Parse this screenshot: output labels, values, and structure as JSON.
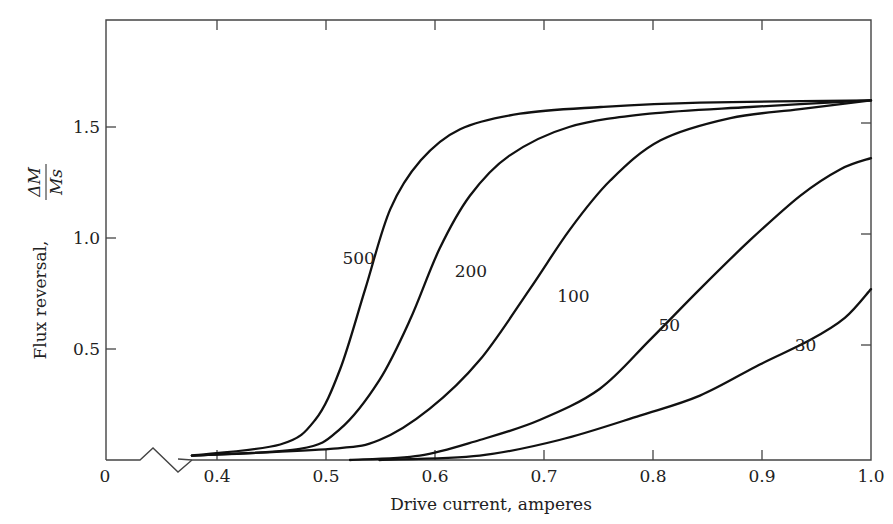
{
  "chart_data": {
    "type": "line",
    "title": "",
    "xlabel": "Drive current, amperes",
    "ylabel": "Flux reversal, ΔM / Ms",
    "ylabel_parts": {
      "text": "Flux reversal,",
      "numerator": "ΔM",
      "denominator": "Ms"
    },
    "xlim": [
      0.4,
      1.0
    ],
    "ylim": [
      0,
      1.95
    ],
    "x_axis_break": true,
    "x_origin_label": "0",
    "x_ticks": [
      0.4,
      0.5,
      0.6,
      0.7,
      0.8,
      0.9,
      1.0
    ],
    "x_tick_labels": [
      "0.4",
      "0.5",
      "0.6",
      "0.7",
      "0.8",
      "0.9",
      "1.0"
    ],
    "y_ticks": [
      0.5,
      1.0,
      1.5
    ],
    "y_tick_labels": [
      "0.5",
      "1.0",
      "1.5"
    ],
    "grid": false,
    "legend": "inline curve labels",
    "series": [
      {
        "name": "500",
        "label_pos": [
          0.53,
          0.91
        ],
        "points": [
          [
            0.377,
            0.02
          ],
          [
            0.458,
            0.07
          ],
          [
            0.49,
            0.18
          ],
          [
            0.513,
            0.41
          ],
          [
            0.536,
            0.77
          ],
          [
            0.559,
            1.13
          ],
          [
            0.587,
            1.35
          ],
          [
            0.623,
            1.49
          ],
          [
            0.678,
            1.56
          ],
          [
            0.752,
            1.59
          ],
          [
            0.843,
            1.61
          ],
          [
            1.0,
            1.62
          ]
        ]
      },
      {
        "name": "200",
        "label_pos": [
          0.633,
          0.85
        ],
        "points": [
          [
            0.377,
            0.02
          ],
          [
            0.476,
            0.05
          ],
          [
            0.513,
            0.14
          ],
          [
            0.549,
            0.36
          ],
          [
            0.577,
            0.63
          ],
          [
            0.604,
            0.95
          ],
          [
            0.632,
            1.19
          ],
          [
            0.668,
            1.37
          ],
          [
            0.723,
            1.5
          ],
          [
            0.797,
            1.56
          ],
          [
            0.889,
            1.59
          ],
          [
            1.0,
            1.62
          ]
        ]
      },
      {
        "name": "100",
        "label_pos": [
          0.727,
          0.74
        ],
        "points": [
          [
            0.377,
            0.02
          ],
          [
            0.504,
            0.05
          ],
          [
            0.549,
            0.09
          ],
          [
            0.595,
            0.23
          ],
          [
            0.641,
            0.45
          ],
          [
            0.687,
            0.77
          ],
          [
            0.724,
            1.04
          ],
          [
            0.761,
            1.26
          ],
          [
            0.807,
            1.44
          ],
          [
            0.871,
            1.54
          ],
          [
            0.935,
            1.58
          ],
          [
            1.0,
            1.62
          ]
        ]
      },
      {
        "name": "50",
        "label_pos": [
          0.815,
          0.61
        ],
        "points": [
          [
            0.522,
            0.0
          ],
          [
            0.586,
            0.02
          ],
          [
            0.641,
            0.09
          ],
          [
            0.696,
            0.18
          ],
          [
            0.751,
            0.32
          ],
          [
            0.797,
            0.54
          ],
          [
            0.843,
            0.77
          ],
          [
            0.889,
            0.99
          ],
          [
            0.935,
            1.19
          ],
          [
            0.972,
            1.31
          ],
          [
            1.0,
            1.36
          ]
        ]
      },
      {
        "name": "30",
        "label_pos": [
          0.94,
          0.52
        ],
        "points": [
          [
            0.549,
            0.0
          ],
          [
            0.641,
            0.02
          ],
          [
            0.714,
            0.09
          ],
          [
            0.788,
            0.2
          ],
          [
            0.843,
            0.29
          ],
          [
            0.898,
            0.43
          ],
          [
            0.944,
            0.54
          ],
          [
            0.976,
            0.64
          ],
          [
            1.0,
            0.77
          ]
        ]
      }
    ]
  }
}
